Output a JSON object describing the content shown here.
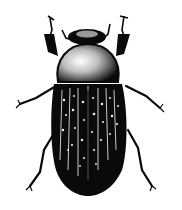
{
  "image": {
    "subject": "beetle illustration",
    "description": "Black-and-white stippled drawing of a beetle viewed from above, with antennae, pronotum, striated spotted elytra and six legs",
    "colors": {
      "background": "#ffffff",
      "ink": "#0a0a0a",
      "highlight": "#f2f2f2"
    }
  }
}
